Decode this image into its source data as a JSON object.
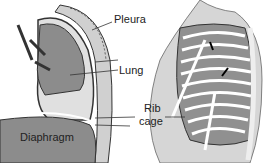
{
  "labels": {
    "pleura": "Pleura",
    "lung": "Lung",
    "rib": "Rib",
    "cage": "cage",
    "diaphragm": "Diaphragm"
  },
  "colors": {
    "tissue": "#8c8c8c",
    "light": "#c8c8c8",
    "outline": "#333333"
  }
}
